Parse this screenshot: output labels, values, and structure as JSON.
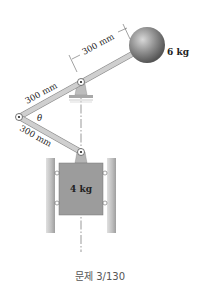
{
  "diagram": {
    "labels": {
      "upper_arm_length": "300 mm",
      "lower_arm_length": "300 mm",
      "ball_arm_length": "300 mm",
      "ball_mass": "6 kg",
      "block_mass": "4 kg",
      "angle": "θ"
    },
    "caption": "문제 3/130",
    "colors": {
      "link": "#c8c8c8",
      "link_edge": "#8a8a8a",
      "ball": "#8c8c8c",
      "block": "#9a9a9a",
      "rail": "#c4c4c4"
    }
  }
}
